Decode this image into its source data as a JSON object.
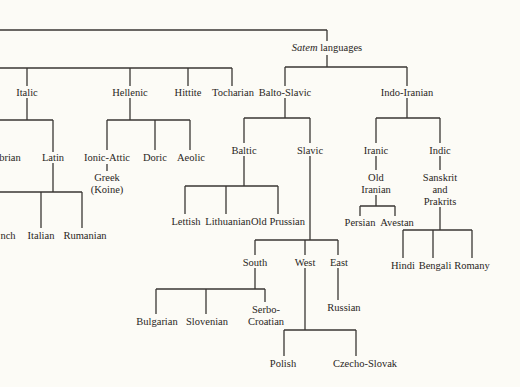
{
  "diagram": {
    "type": "language-family-tree",
    "root": {
      "label": "Satem languages",
      "label_italic_part": "Satem",
      "label_rest": "languages"
    },
    "nodes": {
      "italic": "Italic",
      "hellenic": "Hellenic",
      "hittite": "Hittite",
      "tocharian": "Tocharian",
      "balto_slavic": "Balto-Slavic",
      "indo_iranian": "Indo-Iranian",
      "umbrian": "brian",
      "latin": "Latin",
      "ionic_attic": "Ionic-Attic",
      "greek_koine": "Greek\n(Koine)",
      "doric": "Doric",
      "aeolic": "Aeolic",
      "baltic": "Baltic",
      "slavic": "Slavic",
      "iranic": "Iranic",
      "indic": "Indic",
      "old_iranian": "Old\nIranian",
      "sanskrit_prakrits": "Sanskrit\nand\nPrakrits",
      "french": "nch",
      "italian": "Italian",
      "rumanian": "Rumanian",
      "lettish": "Lettish",
      "lithuanian": "Lithuanian",
      "old_prussian": "Old Prussian",
      "persian": "Persian",
      "avestan": "Avestan",
      "hindi": "Hindi",
      "bengali": "Bengali",
      "romany": "Romany",
      "south": "South",
      "west": "West",
      "east": "East",
      "bulgarian": "Bulgarian",
      "slovenian": "Slovenian",
      "serbo_croatian": "Serbo-\nCroatian",
      "russian": "Russian",
      "polish": "Polish",
      "czecho_slovak": "Czecho-Slovak"
    },
    "edges": [
      [
        "Satem languages",
        "Balto-Slavic"
      ],
      [
        "Satem languages",
        "Indo-Iranian"
      ],
      [
        "Italic",
        "Umbrian"
      ],
      [
        "Italic",
        "Latin"
      ],
      [
        "Latin",
        "French"
      ],
      [
        "Latin",
        "Italian"
      ],
      [
        "Latin",
        "Rumanian"
      ],
      [
        "Hellenic",
        "Ionic-Attic"
      ],
      [
        "Hellenic",
        "Doric"
      ],
      [
        "Hellenic",
        "Aeolic"
      ],
      [
        "Ionic-Attic",
        "Greek (Koine)"
      ],
      [
        "Balto-Slavic",
        "Baltic"
      ],
      [
        "Balto-Slavic",
        "Slavic"
      ],
      [
        "Baltic",
        "Lettish"
      ],
      [
        "Baltic",
        "Lithuanian"
      ],
      [
        "Baltic",
        "Old Prussian"
      ],
      [
        "Slavic",
        "South"
      ],
      [
        "Slavic",
        "West"
      ],
      [
        "Slavic",
        "East"
      ],
      [
        "South",
        "Bulgarian"
      ],
      [
        "South",
        "Slovenian"
      ],
      [
        "South",
        "Serbo-Croatian"
      ],
      [
        "West",
        "Polish"
      ],
      [
        "West",
        "Czecho-Slovak"
      ],
      [
        "East",
        "Russian"
      ],
      [
        "Indo-Iranian",
        "Iranic"
      ],
      [
        "Indo-Iranian",
        "Indic"
      ],
      [
        "Iranic",
        "Old Iranian"
      ],
      [
        "Old Iranian",
        "Persian"
      ],
      [
        "Old Iranian",
        "Avestan"
      ],
      [
        "Indic",
        "Sanskrit and Prakrits"
      ],
      [
        "Sanskrit and Prakrits",
        "Hindi"
      ],
      [
        "Sanskrit and Prakrits",
        "Bengali"
      ],
      [
        "Sanskrit and Prakrits",
        "Romany"
      ]
    ]
  },
  "colors": {
    "background": "#fcfbf6",
    "line": "#3a3633",
    "text": "#2a2623"
  }
}
